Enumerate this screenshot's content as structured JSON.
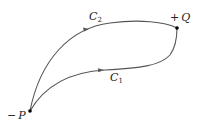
{
  "diagram": {
    "points": [
      {
        "id": "P",
        "sign": "−",
        "name": "P",
        "x": 30,
        "y": 111
      },
      {
        "id": "Q",
        "sign": "+",
        "name": "Q",
        "x": 177,
        "y": 28
      }
    ],
    "curves": [
      {
        "id": "C2",
        "label": "C",
        "subscript": "2",
        "from": "P",
        "to": "Q",
        "position": "upper"
      },
      {
        "id": "C1",
        "label": "C",
        "subscript": "1",
        "from": "P",
        "to": "Q",
        "position": "lower"
      }
    ],
    "colors": {
      "curve": "#555555",
      "point": "#000000",
      "text": "#222222"
    }
  }
}
